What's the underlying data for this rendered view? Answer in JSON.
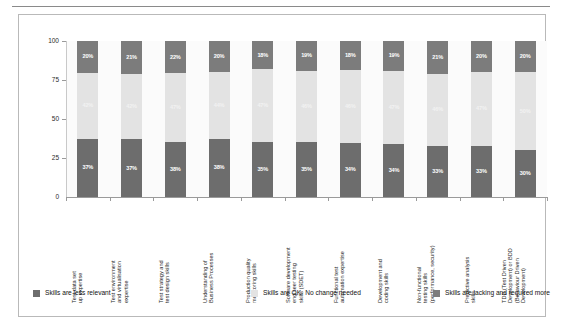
{
  "chart_data": {
    "type": "bar",
    "subtype": "stacked-100-percent",
    "title": "",
    "xlabel": "",
    "ylabel": "",
    "ylim": [
      0,
      100
    ],
    "yticks": [
      0,
      25,
      50,
      75,
      100
    ],
    "ytick_labels": [
      "0",
      "25",
      "50",
      "75",
      "100"
    ],
    "grid": false,
    "legend_position": "bottom",
    "categories": [
      "Test data set up expertise",
      "Test environment and virtualisation expertise",
      "Test strategy and test design skills",
      "Understanding of Business Processes",
      "Production quality monitoring skills",
      "Software development engineer testing skills (SDET)",
      "Functional test automation expertise",
      "Development and coding skills",
      "Non-functional testing skills (performance, security)",
      "Predictive analysis skills",
      "TDD (Test Driven Development) or BDD (Behaviour Driven Development)"
    ],
    "category_lines": [
      [
        "Test data set",
        "up expertise"
      ],
      [
        "Test environment",
        "and virtualisation",
        "expertise"
      ],
      [
        "Test strategy and",
        "test design skills"
      ],
      [
        "Understanding of",
        "Business Processes"
      ],
      [
        "Production quality",
        "monitoring skills"
      ],
      [
        "Software development",
        "engineer testing",
        "skills (SDET)"
      ],
      [
        "Functional test",
        "automation expertise"
      ],
      [
        "Development and",
        "coding skills"
      ],
      [
        "Non-functional",
        "testing skills",
        "(performance, security)"
      ],
      [
        "Predictive analysis",
        "skills"
      ],
      [
        "TDD (Test Driven",
        "Development) or BDD",
        "(Behaviour Driven",
        "Development)"
      ]
    ],
    "series": [
      {
        "name": "Skills are less relevant",
        "color": "#6d6d6d",
        "stack_position": "bottom",
        "values": [
          37,
          37,
          38,
          38,
          35,
          35,
          34,
          34,
          33,
          33,
          30
        ],
        "labels": [
          "37%",
          "37%",
          "38%",
          "38%",
          "35%",
          "35%",
          "34%",
          "34%",
          "33%",
          "33%",
          "30%"
        ]
      },
      {
        "name": "Skills are OK- No change needed",
        "color": "#e3e3e3",
        "stack_position": "middle",
        "values": [
          42,
          42,
          47,
          44,
          47,
          46,
          46,
          47,
          46,
          47,
          50
        ],
        "labels": [
          "42%",
          "42%",
          "47%",
          "44%",
          "47%",
          "46%",
          "46%",
          "47%",
          "46%",
          "47%",
          "50%"
        ]
      },
      {
        "name": "Skills are lacking and required more",
        "color": "#7c7c7c",
        "stack_position": "top",
        "values": [
          20,
          21,
          22,
          20,
          18,
          19,
          18,
          19,
          21,
          20,
          20
        ],
        "labels": [
          "20%",
          "21%",
          "22%",
          "20%",
          "18%",
          "19%",
          "18%",
          "19%",
          "21%",
          "20%",
          "20%"
        ]
      }
    ]
  },
  "legend": {
    "items": [
      {
        "label": "Skills are less relevant",
        "color": "#6d6d6d"
      },
      {
        "label": "Skills are OK- No change needed",
        "color": "#e3e3e3"
      },
      {
        "label": "Skills are lacking and required more",
        "color": "#7c7c7c"
      }
    ]
  },
  "colors": {
    "less_relevant": "#6d6d6d",
    "ok_no_change": "#e3e3e3",
    "lacking_required": "#7c7c7c",
    "panel_background": "#fbfbfb",
    "frame_border": "#b9b9b9",
    "axis": "#9a9a9a"
  }
}
